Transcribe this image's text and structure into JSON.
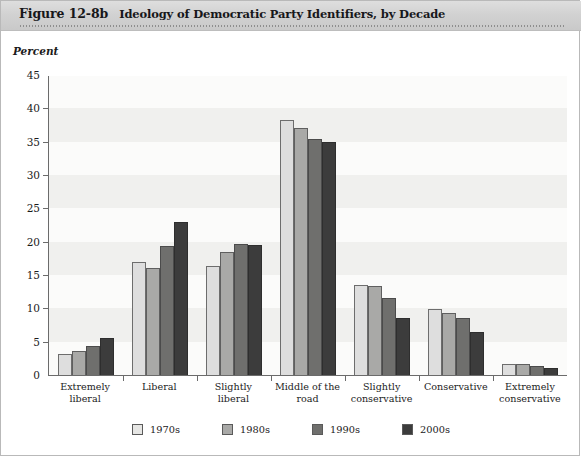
{
  "header": {
    "figure_number": "Figure 12-8b",
    "title": "Ideology of Democratic Party Identifiers, by Decade"
  },
  "axis_caption": "Percent",
  "chart_data": {
    "type": "bar",
    "title": "Ideology of Democratic Party Identifiers, by Decade",
    "xlabel": "",
    "ylabel": "Percent",
    "ylim": [
      0,
      45
    ],
    "yticks": [
      0,
      5,
      10,
      15,
      20,
      25,
      30,
      35,
      40,
      45
    ],
    "grid": false,
    "legend_position": "bottom",
    "categories": [
      "Extremely liberal",
      "Liberal",
      "Slightly liberal",
      "Middle of the road",
      "Slightly conservative",
      "Conservative",
      "Extremely conservative"
    ],
    "category_lines": [
      [
        "Extremely",
        "liberal"
      ],
      [
        "Liberal",
        ""
      ],
      [
        "Slightly",
        "liberal"
      ],
      [
        "Middle of the",
        "road"
      ],
      [
        "Slightly",
        "conservative"
      ],
      [
        "Conservative",
        ""
      ],
      [
        "Extremely",
        "conservative"
      ]
    ],
    "series": [
      {
        "name": "1970s",
        "color": "#dedede",
        "values": [
          3.1,
          17.0,
          16.3,
          38.2,
          13.5,
          9.9,
          1.7
        ]
      },
      {
        "name": "1980s",
        "color": "#a9a9a7",
        "values": [
          3.6,
          16.1,
          18.5,
          37.0,
          13.4,
          9.3,
          1.7
        ]
      },
      {
        "name": "1990s",
        "color": "#6f6f6d",
        "values": [
          4.3,
          19.3,
          19.6,
          35.4,
          11.6,
          8.5,
          1.3
        ]
      },
      {
        "name": "2000s",
        "color": "#3c3c3c",
        "values": [
          5.6,
          23.0,
          19.5,
          35.0,
          8.6,
          6.5,
          1.1
        ]
      }
    ]
  }
}
